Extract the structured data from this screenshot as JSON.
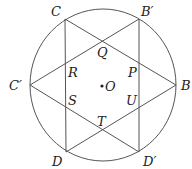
{
  "diagram": {
    "type": "geometry",
    "circle": {
      "cx": 103,
      "cy": 85,
      "rx": 73,
      "ry": 76
    },
    "points": {
      "C": {
        "x": 65,
        "y": 19
      },
      "B'": {
        "x": 139,
        "y": 19
      },
      "C'": {
        "x": 30,
        "y": 85
      },
      "B": {
        "x": 176,
        "y": 85
      },
      "D": {
        "x": 66,
        "y": 152
      },
      "D'": {
        "x": 139,
        "y": 152
      },
      "O": {
        "x": 102,
        "y": 86
      }
    },
    "labels": {
      "C": "C",
      "B_prime": "B′",
      "C_prime": "C′",
      "B": "B",
      "D": "D",
      "D_prime": "D′",
      "Q": "Q",
      "R": "R",
      "P": "P",
      "S": "S",
      "U": "U",
      "T": "T",
      "O": "O"
    }
  }
}
